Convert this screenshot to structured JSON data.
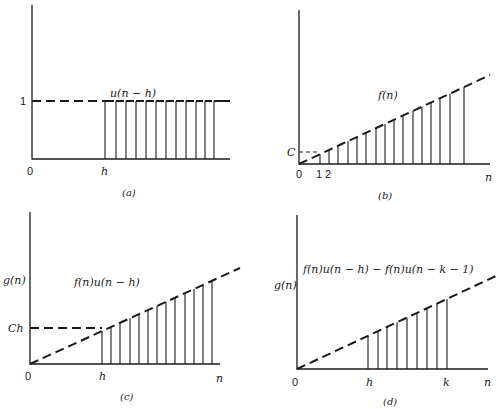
{
  "figure": {
    "panels": [
      {
        "id": "a",
        "caption": "(a)",
        "curve_label": "u(n − h)",
        "y_level_label": "1",
        "x_labels": [
          "0",
          "h"
        ]
      },
      {
        "id": "b",
        "caption": "(b)",
        "curve_label": "f(n)",
        "y_level_label": "C",
        "x_labels": [
          "0",
          "1",
          "2",
          "n"
        ]
      },
      {
        "id": "c",
        "caption": "(c)",
        "y_axis_label": "g(n)",
        "curve_label": "f(n)u(n − h)",
        "y_level_label": "Ch",
        "x_labels": [
          "0",
          "h",
          "n"
        ]
      },
      {
        "id": "d",
        "caption": "(d)",
        "y_axis_label": "g(n)",
        "curve_label": "f(n)u(n − h) − f(n)u(n − k − 1)",
        "x_labels": [
          "0",
          "h",
          "k",
          "n"
        ]
      }
    ]
  },
  "chart_data": [
    {
      "type": "stem",
      "title": "(a)",
      "series_label": "u(n − h)",
      "description": "Shifted unit step: zero for n < h, 1 for n ≥ h",
      "geometry": {
        "origin": [
          32,
          159
        ],
        "axis_top": 5,
        "axis_right": 230,
        "level_y": 101,
        "dash_from_x": 32,
        "dash_to_x": 105,
        "line_end_x": 230
      },
      "stems_x": [
        105,
        116,
        126,
        136,
        146,
        156,
        166,
        176,
        186,
        196,
        205,
        214
      ],
      "values_note": "all stems height 1"
    },
    {
      "type": "stem",
      "title": "(b)",
      "series_label": "f(n)",
      "description": "Ramp f(n) = C·n",
      "geometry": {
        "origin": [
          299,
          164
        ],
        "axis_top": 10,
        "axis_right": 490,
        "line_end": [
          490,
          75
        ],
        "c_level_y": 152,
        "c_x": 320
      },
      "stems_x": [
        320,
        329,
        338,
        348,
        357,
        366,
        376,
        385,
        394,
        403,
        413,
        422,
        431,
        440,
        450,
        464
      ]
    },
    {
      "type": "stem",
      "title": "(c)",
      "series_label": "f(n)u(n − h)",
      "ylabel": "g(n)",
      "description": "Ramp gated on for n ≥ h; value Ch at n = h",
      "geometry": {
        "origin": [
          30,
          364
        ],
        "axis_top": 212,
        "axis_right": 220,
        "line_end": [
          240,
          268
        ],
        "ch_level_y": 328,
        "h_x": 102
      },
      "stems_x": [
        102,
        111,
        120,
        130,
        139,
        148,
        157,
        166,
        175,
        185,
        194,
        203,
        212
      ]
    },
    {
      "type": "stem",
      "title": "(d)",
      "series_label": "f(n)u(n − h) − f(n)u(n − k − 1)",
      "ylabel": "g(n)",
      "description": "Ramp windowed to h ≤ n ≤ k",
      "geometry": {
        "origin": [
          297,
          369
        ],
        "axis_top": 215,
        "axis_right": 488,
        "line_end": [
          496,
          276
        ]
      },
      "stems_x": [
        368,
        378,
        387,
        397,
        407,
        417,
        427,
        437,
        447
      ]
    }
  ]
}
